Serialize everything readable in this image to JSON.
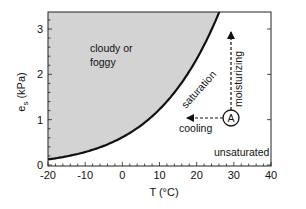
{
  "chart_data": {
    "type": "area",
    "title": "",
    "xlabel": "T (°C)",
    "ylabel": "e_s (kPa)",
    "ylabel_main": "e",
    "ylabel_sub": "s",
    "ylabel_unit": " (kPa)",
    "xlim": [
      -20,
      40
    ],
    "ylim": [
      0,
      3.4
    ],
    "x_ticks": [
      -20,
      -10,
      0,
      10,
      20,
      30,
      40
    ],
    "y_ticks": [
      0,
      1,
      2,
      3
    ],
    "grid": false,
    "legend": null,
    "series": [
      {
        "name": "saturation",
        "x": [
          -20,
          -15,
          -10,
          -5,
          0,
          5,
          10,
          15,
          20,
          25,
          27
        ],
        "values": [
          0.1,
          0.17,
          0.29,
          0.42,
          0.61,
          0.87,
          1.23,
          1.7,
          2.34,
          3.17,
          3.57
        ],
        "fill_above": "#d3d3d3"
      }
    ],
    "annotations": [
      {
        "text": "cloudy or",
        "x": -4,
        "y": 2.6
      },
      {
        "text": "foggy",
        "x": -4,
        "y": 2.3
      },
      {
        "text": "saturation",
        "x": 14,
        "y": 1.7,
        "rotation": -48
      },
      {
        "text": "moisturizing",
        "x": 31,
        "y": 2.3,
        "rotation": 90
      },
      {
        "text": "cooling",
        "x": 13,
        "y": 0.82
      },
      {
        "text": "unsaturated",
        "x": 30,
        "y": 0.33
      },
      {
        "text": "A",
        "x": 29,
        "y": 1.04,
        "type": "circled-point"
      }
    ],
    "arrows": [
      {
        "name": "cooling",
        "from": [
          29,
          1.04
        ],
        "to": [
          9.5,
          1.04
        ],
        "style": "dashed"
      },
      {
        "name": "moisturizing",
        "from": [
          29,
          1.04
        ],
        "to": [
          29,
          2.95
        ],
        "style": "dashed"
      }
    ],
    "regions": [
      {
        "label": "cloudy or foggy",
        "position": "above curve",
        "fill": "#d3d3d3"
      },
      {
        "label": "unsaturated",
        "position": "below curve",
        "fill": "#ffffff"
      }
    ]
  },
  "labels": {
    "cloudy_line1": "cloudy or",
    "cloudy_line2": "foggy",
    "saturation": "saturation",
    "moisturizing": "moisturizing",
    "cooling": "cooling",
    "unsaturated": "unsaturated",
    "point_a": "A",
    "x_title": "T (°C)",
    "y_main": "e",
    "y_sub": "s",
    "y_unit": " (kPa)"
  },
  "colors": {
    "fill": "#d3d3d3",
    "line": "#111111",
    "background": "#ffffff"
  }
}
